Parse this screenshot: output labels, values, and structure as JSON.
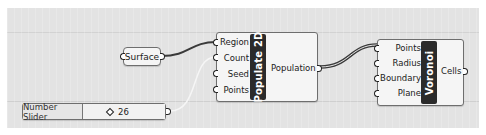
{
  "canvas": {
    "background": "#e3e3e3"
  },
  "surface_param": {
    "label": "Surface"
  },
  "number_slider": {
    "label": "Number Slider",
    "value": "26",
    "value_icon": "diamond-icon"
  },
  "populate2d": {
    "title": "Populate 2D",
    "inputs": [
      "Region",
      "Count",
      "Seed",
      "Points"
    ],
    "outputs": [
      "Population"
    ]
  },
  "voronoi": {
    "title": "Voronoi",
    "inputs": [
      "Points",
      "Radius",
      "Boundary",
      "Plane"
    ],
    "outputs": [
      "Cells"
    ]
  },
  "wires": [
    {
      "from": "Surface",
      "to": "Populate 2D.Region",
      "style": "single"
    },
    {
      "from": "Number Slider",
      "to": "Populate 2D.Count",
      "style": "faint"
    },
    {
      "from": "Populate 2D.Population",
      "to": "Voronoi.Points",
      "style": "list"
    }
  ]
}
